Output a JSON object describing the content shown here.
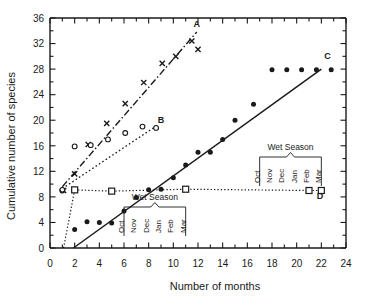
{
  "chart_data": {
    "type": "scatter",
    "title": "",
    "xlabel": "Number of months",
    "ylabel": "Cumulative number of species",
    "xlim": [
      0,
      24
    ],
    "ylim": [
      0,
      36
    ],
    "xticks": [
      0,
      2,
      4,
      6,
      8,
      10,
      12,
      14,
      16,
      18,
      20,
      22,
      24
    ],
    "yticks": [
      0,
      4,
      8,
      12,
      16,
      20,
      24,
      28,
      32,
      36
    ],
    "xtick_labels": [
      "0",
      "2",
      "4",
      "6",
      "8",
      "10",
      "12",
      "14",
      "16",
      "18",
      "20",
      "22",
      "24"
    ],
    "ytick_labels": [
      "0",
      "4",
      "8",
      "12",
      "16",
      "20",
      "24",
      "28",
      "32",
      "36"
    ],
    "minor_tick_interval": 1,
    "grid": false,
    "legend": "inline-endpoint-labels",
    "series": [
      {
        "name": "A",
        "label": "A",
        "marker": "x",
        "line": "dash-dot",
        "label_x": 11.9,
        "label_y": 34.6,
        "points": [
          {
            "x": 1.1,
            "y": 9.0
          },
          {
            "x": 2.0,
            "y": 11.6
          },
          {
            "x": 3.1,
            "y": 16.2
          },
          {
            "x": 4.6,
            "y": 19.5
          },
          {
            "x": 6.1,
            "y": 22.6
          },
          {
            "x": 7.6,
            "y": 25.9
          },
          {
            "x": 9.1,
            "y": 28.9
          },
          {
            "x": 10.2,
            "y": 30.0
          },
          {
            "x": 11.5,
            "y": 32.4
          },
          {
            "x": 12.0,
            "y": 31.1
          }
        ],
        "fit_line": {
          "x1": 1.0,
          "y1": 9.6,
          "x2": 11.9,
          "y2": 33.8
        }
      },
      {
        "name": "B",
        "label": "B",
        "marker": "open-circle",
        "line": "dotted",
        "label_x": 9.0,
        "label_y": 19.6,
        "points": [
          {
            "x": 1.0,
            "y": 9.0
          },
          {
            "x": 2.0,
            "y": 15.9
          },
          {
            "x": 3.3,
            "y": 16.1
          },
          {
            "x": 4.7,
            "y": 17.0
          },
          {
            "x": 6.1,
            "y": 18.0
          },
          {
            "x": 7.5,
            "y": 19.0
          },
          {
            "x": 8.6,
            "y": 18.8
          }
        ],
        "fit_line": {
          "x1": 1.0,
          "y1": 9.3,
          "x2": 8.7,
          "y2": 19.2
        }
      },
      {
        "name": "C",
        "label": "C",
        "marker": "filled-circle",
        "line": "solid",
        "label_x": 22.5,
        "label_y": 29.6,
        "points": [
          {
            "x": 2.0,
            "y": 2.9
          },
          {
            "x": 3.0,
            "y": 4.1
          },
          {
            "x": 4.0,
            "y": 4.0
          },
          {
            "x": 5.0,
            "y": 3.9
          },
          {
            "x": 6.0,
            "y": 5.8
          },
          {
            "x": 7.0,
            "y": 7.9
          },
          {
            "x": 8.0,
            "y": 9.1
          },
          {
            "x": 9.0,
            "y": 9.2
          },
          {
            "x": 10.0,
            "y": 11.0
          },
          {
            "x": 11.0,
            "y": 13.0
          },
          {
            "x": 12.0,
            "y": 15.0
          },
          {
            "x": 13.0,
            "y": 15.0
          },
          {
            "x": 14.0,
            "y": 17.0
          },
          {
            "x": 15.0,
            "y": 20.0
          },
          {
            "x": 16.5,
            "y": 22.5
          },
          {
            "x": 18.0,
            "y": 27.9
          },
          {
            "x": 19.2,
            "y": 27.9
          },
          {
            "x": 20.4,
            "y": 27.9
          },
          {
            "x": 21.6,
            "y": 27.9
          },
          {
            "x": 22.8,
            "y": 27.9
          }
        ],
        "fit_line": {
          "x1": 1.9,
          "y1": 0.0,
          "x2": 22.0,
          "y2": 28.0
        }
      },
      {
        "name": "D",
        "label": "D",
        "marker": "open-square",
        "line": "dotted",
        "label_x": 21.9,
        "label_y": 7.6,
        "points": [
          {
            "x": 2.0,
            "y": 9.1
          },
          {
            "x": 5.0,
            "y": 8.9
          },
          {
            "x": 11.0,
            "y": 9.2
          },
          {
            "x": 21.0,
            "y": 9.0
          },
          {
            "x": 22.0,
            "y": 9.0
          }
        ],
        "fit_line": {
          "x1": 1.1,
          "y1": 0.0,
          "x2": 2.0,
          "y2": 9.1
        }
      }
    ],
    "annotations": [
      {
        "name": "wet-season-left",
        "text": "Wet Season",
        "months": [
          "Oct",
          "Nov",
          "Dec",
          "Jan",
          "Feb",
          "Mar"
        ],
        "month_x": [
          6,
          7,
          8,
          9,
          10,
          11
        ],
        "bracket_from": 6,
        "bracket_to": 11
      },
      {
        "name": "wet-season-right",
        "text": "Wet Season",
        "months": [
          "Oct",
          "Nov",
          "Dec",
          "Jan",
          "Feb",
          "Mar"
        ],
        "month_x": [
          17,
          18,
          19,
          20,
          21,
          22
        ],
        "bracket_from": 17,
        "bracket_to": 22
      }
    ],
    "colors": {
      "ink": "#1a1a1a",
      "background": "#ffffff"
    }
  },
  "axes": {
    "x_title": "Number of months",
    "y_title": "Cumulative number of species"
  },
  "series_labels": {
    "a": "A",
    "b": "B",
    "c": "C",
    "d": "D"
  },
  "season_left": {
    "title": "Wet Season",
    "m0": "Oct",
    "m1": "Nov",
    "m2": "Dec",
    "m3": "Jan",
    "m4": "Feb",
    "m5": "Mar"
  },
  "season_right": {
    "title": "Wet Season",
    "m0": "Oct",
    "m1": "Nov",
    "m2": "Dec",
    "m3": "Jan",
    "m4": "Feb",
    "m5": "Mar"
  },
  "y_ticks": {
    "t0": "0",
    "t1": "4",
    "t2": "8",
    "t3": "12",
    "t4": "16",
    "t5": "20",
    "t6": "24",
    "t7": "28",
    "t8": "32",
    "t9": "36"
  },
  "x_ticks": {
    "t0": "0",
    "t1": "2",
    "t2": "4",
    "t3": "6",
    "t4": "8",
    "t5": "10",
    "t6": "12",
    "t7": "14",
    "t8": "16",
    "t9": "18",
    "t10": "20",
    "t11": "22",
    "t12": "24"
  }
}
